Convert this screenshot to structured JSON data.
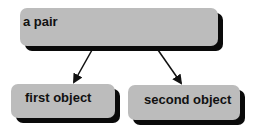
{
  "diagram": {
    "nodes": [
      {
        "id": "top",
        "label": "a pair"
      },
      {
        "id": "first",
        "label": "first object"
      },
      {
        "id": "second",
        "label": "second object"
      }
    ],
    "edges": [
      {
        "from": "a pair",
        "to": "first object"
      },
      {
        "from": "a pair",
        "to": "second object"
      }
    ],
    "colors": {
      "node_fill": "#bcbcbc",
      "node_shadow": "#0a0a0a",
      "arrow": "#111111",
      "background": "#ffffff"
    }
  }
}
